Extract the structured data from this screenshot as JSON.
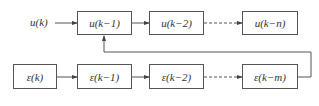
{
  "diagram": {
    "top_row": {
      "input_label": "u(k)",
      "boxes": [
        {
          "label": "u(k−1)"
        },
        {
          "label": "u(k−2)"
        },
        {
          "label": "u(k−n)"
        }
      ]
    },
    "bottom_row": {
      "boxes": [
        {
          "label": "ε(k)"
        },
        {
          "label": "ε(k−1)"
        },
        {
          "label": "ε(k−2)"
        },
        {
          "label": "ε(k−m)"
        }
      ]
    },
    "connections": [
      {
        "from": "u(k)",
        "to": "u(k−1)",
        "style": "solid"
      },
      {
        "from": "u(k−1)",
        "to": "u(k−2)",
        "style": "solid"
      },
      {
        "from": "u(k−2)",
        "to": "u(k−n)",
        "style": "dashed"
      },
      {
        "from": "ε(k)",
        "to": "ε(k−1)",
        "style": "solid"
      },
      {
        "from": "ε(k−1)",
        "to": "ε(k−2)",
        "style": "solid"
      },
      {
        "from": "ε(k−2)",
        "to": "ε(k−m)",
        "style": "dashed"
      },
      {
        "from": "ε(k−m)",
        "to": "u(k−1)",
        "style": "solid",
        "type": "feedback"
      }
    ],
    "colors": {
      "line": "#555555",
      "text": "#333333",
      "background": "#ffffff"
    }
  }
}
